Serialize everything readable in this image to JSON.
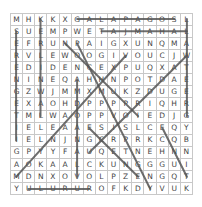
{
  "puzzle": {
    "rows": [
      [
        "M",
        "H",
        "K",
        "K",
        "X",
        "G",
        "A",
        "L",
        "A",
        "P",
        "A",
        "G",
        "O",
        "S",
        "L"
      ],
      [
        "S",
        "U",
        "E",
        "M",
        "P",
        "W",
        "E",
        "T",
        "A",
        "J",
        "M",
        "A",
        "H",
        "A",
        "L"
      ],
      [
        "E",
        "F",
        "R",
        "U",
        "N",
        "P",
        "A",
        "I",
        "G",
        "X",
        "U",
        "N",
        "Q",
        "M",
        "A"
      ],
      [
        "R",
        "V",
        "L",
        "E",
        "W",
        "O",
        "O",
        "G",
        "I",
        "V",
        "O",
        "U",
        "C",
        "J",
        "W"
      ],
      [
        "E",
        "D",
        "I",
        "D",
        "E",
        "N",
        "C",
        "E",
        "X",
        "P",
        "U",
        "Q",
        "X",
        "A",
        "T"
      ],
      [
        "N",
        "I",
        "N",
        "E",
        "Q",
        "A",
        "H",
        "H",
        "N",
        "P",
        "O",
        "T",
        "D",
        "A",
        "E"
      ],
      [
        "G",
        "Z",
        "W",
        "J",
        "M",
        "M",
        "X",
        "M",
        "U",
        "K",
        "Z",
        "D",
        "U",
        "G",
        "E"
      ],
      [
        "E",
        "X",
        "A",
        "O",
        "H",
        "D",
        "P",
        "P",
        "P",
        "P",
        "R",
        "I",
        "Q",
        "H",
        "R"
      ],
      [
        "T",
        "M",
        "L",
        "W",
        "A",
        "O",
        "P",
        "P",
        "V",
        "O",
        "I",
        "E",
        "D",
        "J",
        "G"
      ],
      [
        "I",
        "E",
        "L",
        "E",
        "A",
        "A",
        "E",
        "S",
        "I",
        "S",
        "L",
        "C",
        "E",
        "Q",
        "Y"
      ],
      [
        "I",
        "E",
        "L",
        "N",
        "J",
        "N",
        "G",
        "C",
        "R",
        "P",
        "R",
        "K",
        "C",
        "Q",
        "B"
      ],
      [
        "G",
        "P",
        "Y",
        "Y",
        "F",
        "A",
        "U",
        "Q",
        "E",
        "T",
        "N",
        "E",
        "H",
        "N",
        "N"
      ],
      [
        "A",
        "O",
        "K",
        "A",
        "A",
        "L",
        "C",
        "K",
        "U",
        "N",
        "G",
        "G",
        "G",
        "U",
        "I"
      ],
      [
        "M",
        "D",
        "N",
        "X",
        "O",
        "V",
        "O",
        "L",
        "P",
        "Z",
        "E",
        "N",
        "G",
        "Q",
        "T"
      ],
      [
        "Y",
        "U",
        "L",
        "U",
        "R",
        "U",
        "R",
        "O",
        "F",
        "K",
        "D",
        "Y",
        "V",
        "U",
        "K"
      ]
    ],
    "found_lines": [
      {
        "word": "GALAPAGOS",
        "from": [
          0,
          5
        ],
        "to": [
          0,
          13
        ]
      },
      {
        "word": "TAJMAHAL",
        "from": [
          1,
          7
        ],
        "to": [
          1,
          14
        ]
      },
      {
        "word": "ULURU",
        "from": [
          14,
          1
        ],
        "to": [
          14,
          6
        ]
      },
      {
        "word": "SERENGETI",
        "from": [
          1,
          0
        ],
        "to": [
          10,
          0
        ]
      },
      {
        "word": "KREMLIN",
        "from": [
          0,
          2
        ],
        "to": [
          8,
          2
        ]
      },
      {
        "word": "vertical-col7",
        "from": [
          5,
          5
        ],
        "to": [
          13,
          5
        ]
      },
      {
        "word": "vertical-col15",
        "from": [
          0,
          14
        ],
        "to": [
          8,
          14
        ]
      },
      {
        "word": "diag-1",
        "from": [
          2,
          4
        ],
        "to": [
          8,
          10
        ]
      },
      {
        "word": "diag-2",
        "from": [
          2,
          5
        ],
        "to": [
          14,
          11
        ]
      },
      {
        "word": "diag-3",
        "from": [
          3,
          9
        ],
        "to": [
          13,
          0
        ]
      },
      {
        "word": "diag-4",
        "from": [
          3,
          14
        ],
        "to": [
          11,
          6
        ]
      },
      {
        "word": "diag-5",
        "from": [
          9,
          6
        ],
        "to": [
          13,
          10
        ]
      },
      {
        "word": "diag-6",
        "from": [
          9,
          12
        ],
        "to": [
          13,
          14
        ]
      }
    ]
  }
}
